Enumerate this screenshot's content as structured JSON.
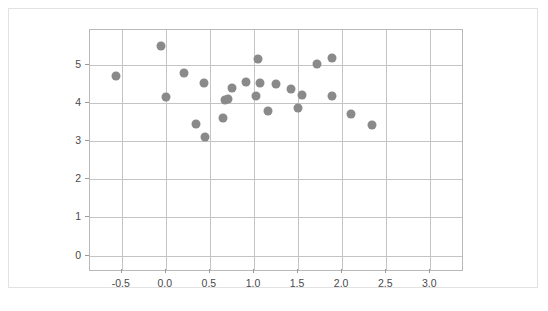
{
  "chart_data": {
    "type": "scatter",
    "title": "",
    "subtitle": "",
    "xlabel": "",
    "ylabel": "",
    "xlim": [
      -0.86,
      3.36
    ],
    "ylim": [
      -0.38,
      5.92
    ],
    "grid": true,
    "legend": null,
    "legend_position": "none",
    "marker": {
      "shape": "circle",
      "color": "#8a8a8a",
      "size_px": 9
    },
    "xticks": [
      -0.5,
      0.0,
      0.5,
      1.0,
      1.5,
      2.0,
      2.5,
      3.0
    ],
    "xtick_labels": [
      "-0.5",
      "0.0",
      "0.5",
      "1.0",
      "1.5",
      "2.0",
      "2.5",
      "3.0"
    ],
    "yticks": [
      0,
      1,
      2,
      3,
      4,
      5
    ],
    "ytick_labels": [
      "0",
      "1",
      "2",
      "3",
      "4",
      "5"
    ],
    "series": [
      {
        "name": "observations",
        "color": "#8a8a8a",
        "points": [
          [
            -0.56,
            4.7
          ],
          [
            -0.05,
            5.49
          ],
          [
            0.0,
            4.17
          ],
          [
            0.21,
            4.78
          ],
          [
            0.34,
            3.45
          ],
          [
            0.43,
            4.54
          ],
          [
            0.44,
            3.11
          ],
          [
            0.65,
            3.6
          ],
          [
            0.67,
            4.07
          ],
          [
            0.7,
            4.1
          ],
          [
            0.75,
            4.41
          ],
          [
            0.91,
            4.56
          ],
          [
            1.02,
            4.18
          ],
          [
            1.05,
            5.17
          ],
          [
            1.07,
            4.53
          ],
          [
            1.16,
            3.79
          ],
          [
            1.25,
            4.51
          ],
          [
            1.42,
            4.37
          ],
          [
            1.5,
            3.87
          ],
          [
            1.54,
            4.22
          ],
          [
            1.71,
            5.02
          ],
          [
            1.88,
            5.18
          ],
          [
            1.89,
            4.18
          ],
          [
            2.1,
            3.72
          ],
          [
            2.34,
            3.43
          ]
        ]
      }
    ]
  },
  "figure": {
    "caption": ""
  }
}
